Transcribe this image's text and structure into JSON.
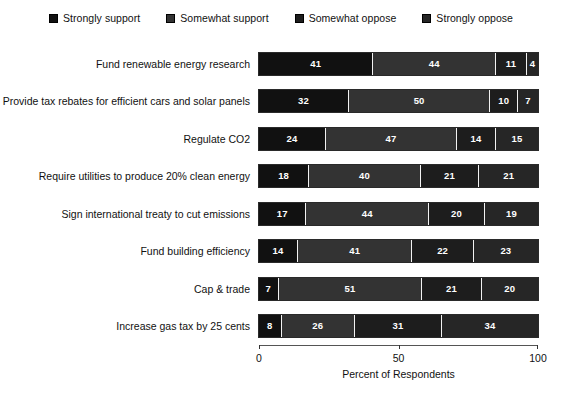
{
  "chart_data": {
    "type": "bar",
    "orientation": "horizontal",
    "stacked": true,
    "title": "",
    "xlabel": "Percent of Respondents",
    "ylabel": "",
    "xlim": [
      0,
      100
    ],
    "xticks": [
      0,
      50,
      100
    ],
    "xticklabels": [
      "0",
      "50",
      "100"
    ],
    "grid": false,
    "legend_position": "top",
    "categories": [
      "Fund renewable energy research",
      "Provide tax rebates for efficient cars and solar panels",
      "Regulate CO2",
      "Require utilities to produce 20% clean energy",
      "Sign international treaty to cut emissions",
      "Fund building efficiency",
      "Cap & trade",
      "Increase gas tax by 25 cents"
    ],
    "series": [
      {
        "name": "Strongly support",
        "color": "#111111",
        "values": [
          41,
          32,
          24,
          18,
          17,
          14,
          7,
          8
        ]
      },
      {
        "name": "Somewhat support",
        "color": "#333333",
        "values": [
          44,
          50,
          47,
          40,
          44,
          41,
          51,
          26
        ]
      },
      {
        "name": "Somewhat oppose",
        "color": "#1d1d1d",
        "values": [
          11,
          10,
          14,
          21,
          20,
          22,
          21,
          31
        ]
      },
      {
        "name": "Strongly oppose",
        "color": "#262626",
        "values": [
          4,
          7,
          15,
          21,
          19,
          23,
          20,
          34
        ]
      }
    ]
  },
  "legend": {
    "items": [
      {
        "label": "Strongly support",
        "color": "#111111"
      },
      {
        "label": "Somewhat support",
        "color": "#333333"
      },
      {
        "label": "Somewhat oppose",
        "color": "#1d1d1d"
      },
      {
        "label": "Strongly oppose",
        "color": "#262626"
      }
    ]
  },
  "axis": {
    "x_title": "Percent of Respondents"
  }
}
